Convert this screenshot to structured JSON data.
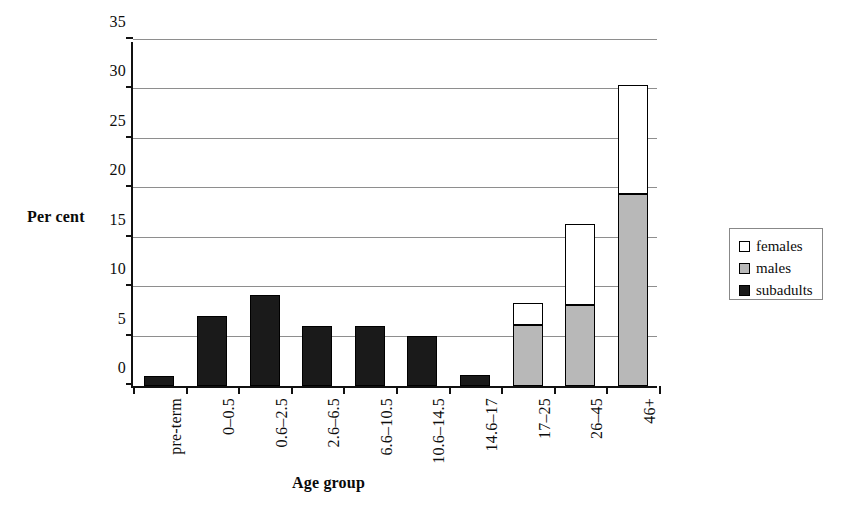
{
  "chart_data": {
    "type": "bar",
    "stacked": true,
    "title": "",
    "xlabel": "Age group",
    "ylabel": "Per cent",
    "ylim": [
      0,
      35
    ],
    "yticks": [
      0,
      5,
      10,
      15,
      20,
      25,
      30,
      35
    ],
    "ytick_labels": [
      "0",
      "5",
      "10",
      "15",
      "20",
      "25",
      "30",
      "35"
    ],
    "grid": "horizontal",
    "legend_position": "right",
    "categories": [
      "pre-term",
      "0–0.5",
      "0.6–2.5",
      "2.6–6.5",
      "6.6–10.5",
      "10.6–14.5",
      "14.6–17",
      "17–25",
      "26–45",
      "46+"
    ],
    "series": [
      {
        "name": "subadults",
        "color": "#1a1a1a",
        "values": [
          1.0,
          7.1,
          9.2,
          6.1,
          6.1,
          5.1,
          1.1,
          0,
          0,
          0
        ]
      },
      {
        "name": "males",
        "color": "#b8b8b8",
        "values": [
          0,
          0,
          0,
          0,
          0,
          0,
          0,
          6.2,
          8.2,
          19.4
        ]
      },
      {
        "name": "females",
        "color": "#ffffff",
        "values": [
          0,
          0,
          0,
          0,
          0,
          0,
          0,
          2.2,
          8.2,
          11.1
        ]
      }
    ],
    "totals": [
      1.0,
      7.1,
      9.2,
      6.1,
      6.1,
      5.1,
      1.1,
      8.4,
      16.4,
      30.5
    ]
  },
  "legend": {
    "items": [
      {
        "label": "females",
        "color": "#ffffff"
      },
      {
        "label": "males",
        "color": "#b8b8b8"
      },
      {
        "label": "subadults",
        "color": "#1a1a1a"
      }
    ]
  }
}
